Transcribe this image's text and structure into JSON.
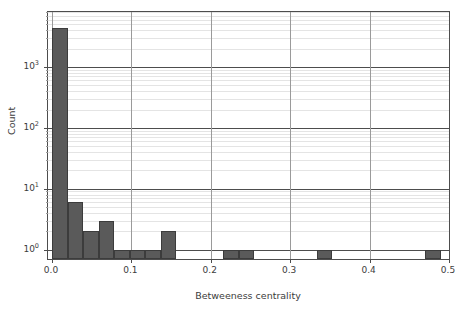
{
  "chart_data": {
    "type": "bar",
    "title": "",
    "xlabel": "Betweeness centrality",
    "ylabel": "Count",
    "xlim": [
      -0.005,
      0.5
    ],
    "ylim": [
      0.7,
      8000
    ],
    "yscale": "log",
    "grid": true,
    "legend": null,
    "bin_width": 0.0196,
    "xticks": [
      "0.0",
      "0.1",
      "0.2",
      "0.3",
      "0.4",
      "0.5"
    ],
    "xtick_values": [
      0.0,
      0.1,
      0.2,
      0.3,
      0.4,
      0.5
    ],
    "yticks": [
      "10^0",
      "10^1",
      "10^2",
      "10^3"
    ],
    "ytick_values": [
      1,
      10,
      100,
      1000
    ],
    "ytick_labels_html": [
      "10",
      "10",
      "10",
      "10"
    ],
    "ytick_exponents": [
      "0",
      "1",
      "2",
      "3"
    ],
    "bin_edges": [
      0.0,
      0.0196,
      0.0392,
      0.0588,
      0.0784,
      0.098,
      0.1176,
      0.1372,
      0.1568,
      0.1764,
      0.196,
      0.2156,
      0.2352,
      0.2548,
      0.2744,
      0.294,
      0.3136,
      0.3332,
      0.3528,
      0.3724,
      0.392,
      0.4116,
      0.4312,
      0.4508,
      0.4704,
      0.49
    ],
    "values": [
      4400,
      6,
      2,
      3,
      1,
      1,
      1,
      2,
      0,
      0,
      0,
      1,
      1,
      0,
      0,
      0,
      0,
      1,
      0,
      0,
      0,
      0,
      0,
      0,
      1
    ],
    "bar_color": "#5a5a5a",
    "edge_color": "#3c3c3c",
    "grid_color": "#e4e4e4",
    "axis_color": "#4d4d4d"
  }
}
